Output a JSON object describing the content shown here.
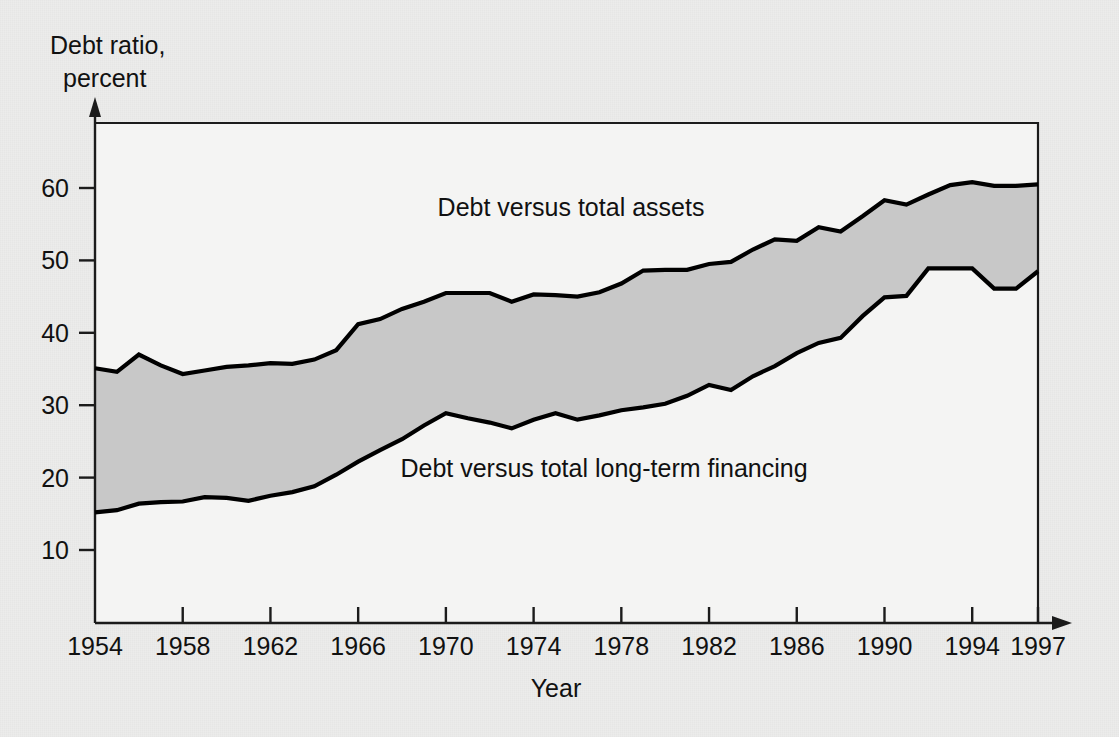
{
  "figure": {
    "background_color": "#ececeb",
    "plot_background_color": "#f4f4f3",
    "band_fill_color": "#c8c8c8",
    "line_color": "#000000",
    "axis_color": "#1b1b1b"
  },
  "labels": {
    "y_axis_title_line1": "Debt ratio,",
    "y_axis_title_line2": "percent",
    "x_axis_title": "Year",
    "annotation_upper": "Debt versus total assets",
    "annotation_lower": "Debt versus total long-term financing"
  },
  "axes": {
    "y_ticks": [
      "10",
      "20",
      "30",
      "40",
      "50",
      "60"
    ],
    "x_ticks": [
      "1954",
      "1958",
      "1962",
      "1966",
      "1970",
      "1974",
      "1978",
      "1982",
      "1986",
      "1990",
      "1994",
      "1997"
    ]
  },
  "chart_data": {
    "type": "area",
    "title": "",
    "xlabel": "Year",
    "ylabel": "Debt ratio, percent",
    "xlim": [
      1954,
      1997
    ],
    "ylim": [
      0,
      68
    ],
    "y_tick_values": [
      10,
      20,
      30,
      40,
      50,
      60
    ],
    "x_tick_values": [
      1954,
      1958,
      1962,
      1966,
      1970,
      1974,
      1978,
      1982,
      1986,
      1990,
      1994,
      1997
    ],
    "grid": false,
    "legend": "inline annotations",
    "x": [
      1954,
      1955,
      1956,
      1957,
      1958,
      1959,
      1960,
      1961,
      1962,
      1963,
      1964,
      1965,
      1966,
      1967,
      1968,
      1969,
      1970,
      1971,
      1972,
      1973,
      1974,
      1975,
      1976,
      1977,
      1978,
      1979,
      1980,
      1981,
      1982,
      1983,
      1984,
      1985,
      1986,
      1987,
      1988,
      1989,
      1990,
      1991,
      1992,
      1993,
      1994,
      1995,
      1996,
      1997
    ],
    "series": [
      {
        "name": "Debt versus total assets",
        "values": [
          35.1,
          34.6,
          37.0,
          35.5,
          34.3,
          34.8,
          35.3,
          35.5,
          35.8,
          35.7,
          36.3,
          37.6,
          41.2,
          41.9,
          43.3,
          44.3,
          45.5,
          45.5,
          45.5,
          44.3,
          45.3,
          45.2,
          45.0,
          45.6,
          46.8,
          48.6,
          48.7,
          48.7,
          49.5,
          49.8,
          51.5,
          52.9,
          52.7,
          54.6,
          54.0,
          56.1,
          58.3,
          57.7,
          59.1,
          60.4,
          60.8,
          60.3,
          60.3,
          60.5
        ]
      },
      {
        "name": "Debt versus total long-term financing",
        "values": [
          15.2,
          15.5,
          16.4,
          16.6,
          16.7,
          17.3,
          17.2,
          16.8,
          17.5,
          18.0,
          18.8,
          20.4,
          22.2,
          23.8,
          25.3,
          27.2,
          28.9,
          28.2,
          27.6,
          26.8,
          28.0,
          28.9,
          28.0,
          28.6,
          29.3,
          29.7,
          30.2,
          31.3,
          32.8,
          32.1,
          34.0,
          35.4,
          37.2,
          38.6,
          39.3,
          42.3,
          44.9,
          45.1,
          48.9,
          48.9,
          48.9,
          46.1,
          46.1,
          48.5
        ]
      }
    ]
  }
}
